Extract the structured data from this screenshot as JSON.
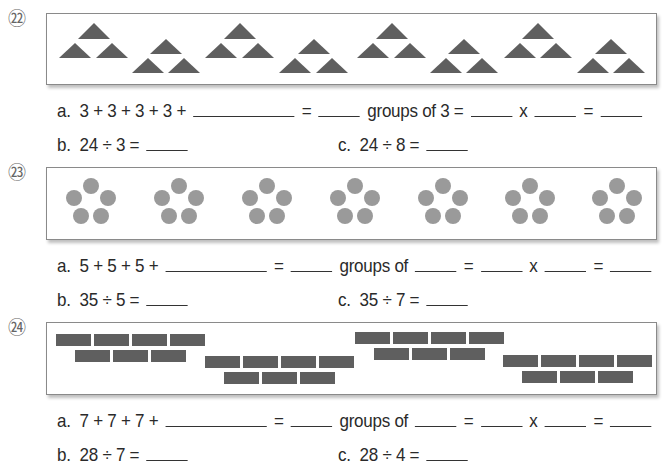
{
  "problems": [
    {
      "number": "㉒",
      "shape": "triangle",
      "group_count": 8,
      "items_per_group": 3,
      "line_a": {
        "label": "a.",
        "repeated_sum": "3 + 3 + 3 + 3 +",
        "eq1": "=",
        "groups_text": "groups of 3 =",
        "times": "x",
        "eq2": "="
      },
      "line_b": {
        "label": "b.",
        "expr": "24 ÷ 3 ="
      },
      "line_c": {
        "label": "c.",
        "expr": "24 ÷ 8 ="
      }
    },
    {
      "number": "㉓",
      "shape": "circle",
      "group_count": 7,
      "items_per_group": 5,
      "line_a": {
        "label": "a.",
        "repeated_sum": "5 + 5 + 5 +",
        "eq1": "=",
        "groups_text": "groups of",
        "eq_mid": "=",
        "times": "x",
        "eq2": "="
      },
      "line_b": {
        "label": "b.",
        "expr": "35 ÷ 5 ="
      },
      "line_c": {
        "label": "c.",
        "expr": "35 ÷ 7 ="
      }
    },
    {
      "number": "㉔",
      "shape": "brick",
      "group_count": 4,
      "items_per_group": 7,
      "line_a": {
        "label": "a.",
        "repeated_sum": "7 + 7 + 7 +",
        "eq1": "=",
        "groups_text": "groups of",
        "eq_mid": "=",
        "times": "x",
        "eq2": "="
      },
      "line_b": {
        "label": "b.",
        "expr": "28 ÷ 7 ="
      },
      "line_c": {
        "label": "c.",
        "expr": "28 ÷ 4 ="
      }
    }
  ],
  "colors": {
    "triangle_fill": "#5f5f5f",
    "circle_fill": "#9a9a9a",
    "brick_fill": "#5f5f5f",
    "box_border": "#8a8a8a"
  }
}
